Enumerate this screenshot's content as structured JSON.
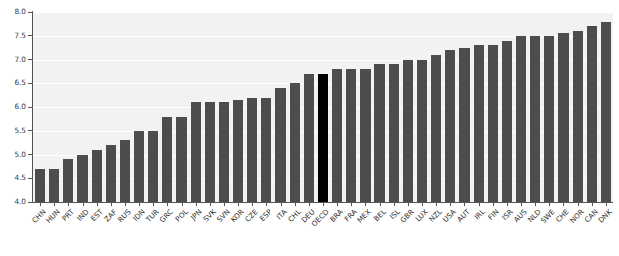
{
  "chart_data": {
    "type": "bar",
    "title": "",
    "subtitle": "",
    "xlabel": "",
    "ylabel": "",
    "ylim": [
      4.0,
      8.0
    ],
    "ytick_labels": [
      "4.0",
      "4.5",
      "5.0",
      "5.5",
      "6.0",
      "6.5",
      "7.0",
      "7.5",
      "8.0"
    ],
    "ytick_values": [
      4.0,
      4.5,
      5.0,
      5.5,
      6.0,
      6.5,
      7.0,
      7.5,
      8.0
    ],
    "grid": true,
    "grid_axis": "y",
    "legend": false,
    "legend_position": "none",
    "highlight_category": "OECD",
    "bar_color": "#4d4d4d",
    "highlight_color": "#000000",
    "plot_background": "#f2f2f2",
    "figure_background": "#ffffff",
    "categories": [
      "CHN",
      "HUN",
      "PRT",
      "IND",
      "EST",
      "ZAF",
      "RUS",
      "IDN",
      "TUR",
      "GRC",
      "POL",
      "JPN",
      "SVK",
      "SVN",
      "KOR",
      "CZE",
      "ESP",
      "ITA",
      "CHL",
      "DEU",
      "OECD",
      "BRA",
      "FRA",
      "MEX",
      "BEL",
      "ISL",
      "GBR",
      "LUX",
      "NZL",
      "USA",
      "AUT",
      "IRL",
      "FIN",
      "ISR",
      "AUS",
      "NLD",
      "SWE",
      "CHE",
      "NOR",
      "CAN",
      "DNK"
    ],
    "values": [
      4.7,
      4.7,
      4.9,
      5.0,
      5.1,
      5.2,
      5.3,
      5.5,
      5.5,
      5.8,
      5.8,
      6.1,
      6.1,
      6.1,
      6.15,
      6.2,
      6.2,
      6.4,
      6.5,
      6.7,
      6.7,
      6.8,
      6.8,
      6.8,
      6.9,
      6.9,
      7.0,
      7.0,
      7.1,
      7.2,
      7.25,
      7.3,
      7.3,
      7.4,
      7.5,
      7.5,
      7.5,
      7.55,
      7.6,
      7.7,
      7.8
    ]
  }
}
